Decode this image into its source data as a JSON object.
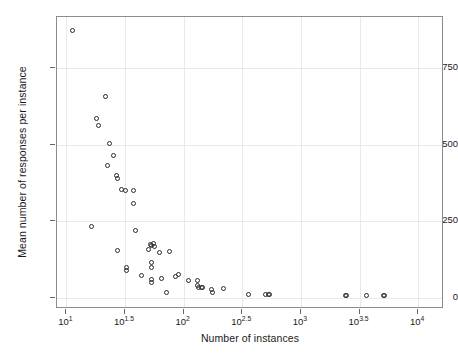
{
  "chart_data": {
    "type": "scatter",
    "title": "",
    "xlabel": "Number of instances",
    "ylabel": "Mean number of responses per instance",
    "x_scale": "log10",
    "y_scale": "linear",
    "grid": true,
    "legend": null,
    "xlim_log10": [
      0.92,
      4.22
    ],
    "ylim": [
      -35,
      915
    ],
    "x_ticks_log10": [
      1,
      1.5,
      2,
      2.5,
      3,
      3.5,
      4
    ],
    "x_tick_labels": [
      "10^1",
      "10^1.5",
      "10^2",
      "10^2.5",
      "10^3",
      "10^3.5",
      "10^4"
    ],
    "x_tick_mantissas": [
      "10",
      "10",
      "10",
      "10",
      "10",
      "10",
      "10"
    ],
    "x_tick_exponents": [
      "1",
      "1.5",
      "2",
      "2.5",
      "3",
      "3.5",
      "4"
    ],
    "y_ticks": [
      0,
      250,
      500,
      750
    ],
    "y_tick_labels": [
      "0",
      "250",
      "500",
      "750"
    ],
    "marker": "open-circle",
    "marker_color": "#2b2b2b",
    "n_points": 62,
    "points": [
      {
        "x_log10": 1.05,
        "y": 872
      },
      {
        "x_log10": 1.33,
        "y": 655
      },
      {
        "x_log10": 1.26,
        "y": 585
      },
      {
        "x_log10": 1.27,
        "y": 562
      },
      {
        "x_log10": 1.37,
        "y": 505
      },
      {
        "x_log10": 1.4,
        "y": 466
      },
      {
        "x_log10": 1.35,
        "y": 432
      },
      {
        "x_log10": 1.43,
        "y": 398
      },
      {
        "x_log10": 1.44,
        "y": 390
      },
      {
        "x_log10": 1.47,
        "y": 355
      },
      {
        "x_log10": 1.5,
        "y": 352
      },
      {
        "x_log10": 1.57,
        "y": 352
      },
      {
        "x_log10": 1.57,
        "y": 308
      },
      {
        "x_log10": 1.21,
        "y": 232
      },
      {
        "x_log10": 1.59,
        "y": 222
      },
      {
        "x_log10": 1.44,
        "y": 155
      },
      {
        "x_log10": 1.72,
        "y": 175
      },
      {
        "x_log10": 1.73,
        "y": 172
      },
      {
        "x_log10": 1.74,
        "y": 178
      },
      {
        "x_log10": 1.75,
        "y": 168
      },
      {
        "x_log10": 1.7,
        "y": 158
      },
      {
        "x_log10": 1.79,
        "y": 150
      },
      {
        "x_log10": 1.88,
        "y": 152
      },
      {
        "x_log10": 1.51,
        "y": 100
      },
      {
        "x_log10": 1.51,
        "y": 90
      },
      {
        "x_log10": 1.73,
        "y": 115
      },
      {
        "x_log10": 1.73,
        "y": 100
      },
      {
        "x_log10": 1.64,
        "y": 73
      },
      {
        "x_log10": 1.73,
        "y": 62
      },
      {
        "x_log10": 1.73,
        "y": 50
      },
      {
        "x_log10": 1.81,
        "y": 65
      },
      {
        "x_log10": 1.93,
        "y": 70
      },
      {
        "x_log10": 1.96,
        "y": 78
      },
      {
        "x_log10": 2.04,
        "y": 58
      },
      {
        "x_log10": 2.12,
        "y": 58
      },
      {
        "x_log10": 2.12,
        "y": 40
      },
      {
        "x_log10": 2.13,
        "y": 34
      },
      {
        "x_log10": 2.15,
        "y": 34
      },
      {
        "x_log10": 2.16,
        "y": 34
      },
      {
        "x_log10": 2.24,
        "y": 30
      },
      {
        "x_log10": 2.25,
        "y": 18
      },
      {
        "x_log10": 1.85,
        "y": 18
      },
      {
        "x_log10": 2.34,
        "y": 32
      },
      {
        "x_log10": 2.55,
        "y": 12
      },
      {
        "x_log10": 2.7,
        "y": 12
      },
      {
        "x_log10": 2.72,
        "y": 12
      },
      {
        "x_log10": 2.73,
        "y": 12
      },
      {
        "x_log10": 3.38,
        "y": 10
      },
      {
        "x_log10": 3.39,
        "y": 10
      },
      {
        "x_log10": 3.56,
        "y": 10
      },
      {
        "x_log10": 3.7,
        "y": 10
      },
      {
        "x_log10": 3.71,
        "y": 10
      }
    ]
  },
  "axes": {
    "y_title": "Mean number of responses per instance",
    "x_title": "Number of instances",
    "y_tick_0": "0",
    "y_tick_250": "250",
    "y_tick_500": "500",
    "y_tick_750": "750",
    "x_tick_base": "10"
  }
}
